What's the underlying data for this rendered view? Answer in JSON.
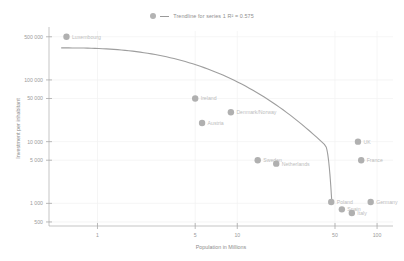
{
  "legend": {
    "marker_name": "series-marker",
    "line_name": "trendline-swatch",
    "text": "Trendline for series 1 R² = 0.575"
  },
  "chart_data": {
    "type": "scatter",
    "title": "",
    "xlabel": "Population in Millions",
    "ylabel": "Investment per inhabitant",
    "xscale": "log",
    "yscale": "log",
    "xlim": [
      0.45,
      130
    ],
    "ylim": [
      430,
      620000
    ],
    "grid": true,
    "legend_position": "top-center",
    "xticks": [
      "1",
      "5",
      "10",
      "50",
      "100"
    ],
    "xtick_values": [
      1,
      5,
      10,
      50,
      100
    ],
    "yticks": [
      "500 000",
      "100 000",
      "50 000",
      "10 000",
      "5 000",
      "1 000",
      "500"
    ],
    "ytick_values": [
      500000,
      100000,
      50000,
      10000,
      5000,
      1000,
      500
    ],
    "points": [
      {
        "label": "Luxembourg",
        "x": 0.6,
        "y": 500000
      },
      {
        "label": "Ireland",
        "x": 5.0,
        "y": 50000
      },
      {
        "label": "Denmark/Norway",
        "x": 9.0,
        "y": 30000
      },
      {
        "label": "Austria",
        "x": 5.6,
        "y": 20000
      },
      {
        "label": "Sweden",
        "x": 14.0,
        "y": 5000
      },
      {
        "label": "Netherlands",
        "x": 19.0,
        "y": 4400
      },
      {
        "label": "UK",
        "x": 73.0,
        "y": 10000
      },
      {
        "label": "France",
        "x": 77.0,
        "y": 5000
      },
      {
        "label": "Poland",
        "x": 47.0,
        "y": 1050
      },
      {
        "label": "Germany",
        "x": 90.0,
        "y": 1050
      },
      {
        "label": "Spain",
        "x": 56.0,
        "y": 800
      },
      {
        "label": "Italy",
        "x": 66.0,
        "y": 700
      }
    ],
    "trendline": {
      "name": "Trendline for series 1",
      "r_squared": 0.575,
      "label": "Trendline for series 1 R² = 0.575"
    },
    "colors": {
      "marker": "#b0b0b0",
      "trendline": "#9e9e9e",
      "grid": "#f1f1f1",
      "axis": "#b6b6b6",
      "tick_text": "#9b9b9b",
      "point_label": "#bdbdbd"
    }
  }
}
